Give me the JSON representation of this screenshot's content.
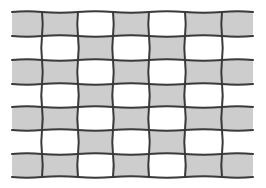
{
  "diagram": {
    "type": "plain-weave-pattern",
    "colors": {
      "fill": "#cdcdcd",
      "line": "#3a3a3a",
      "background": "#ffffff"
    },
    "x_edges": [
      12,
      42,
      78,
      113,
      149,
      185,
      222,
      253
    ],
    "y_edges": [
      12,
      36,
      60,
      84,
      107,
      130,
      154,
      177
    ],
    "rows": [
      [
        1,
        1,
        0,
        1,
        0,
        1,
        1
      ],
      [
        0,
        0,
        1,
        0,
        1,
        0,
        0
      ],
      [
        1,
        1,
        0,
        1,
        0,
        1,
        1
      ],
      [
        0,
        0,
        1,
        0,
        1,
        0,
        0
      ],
      [
        1,
        1,
        0,
        1,
        0,
        1,
        1
      ],
      [
        0,
        0,
        1,
        0,
        1,
        0,
        0
      ],
      [
        1,
        1,
        0,
        1,
        0,
        1,
        1
      ]
    ]
  }
}
